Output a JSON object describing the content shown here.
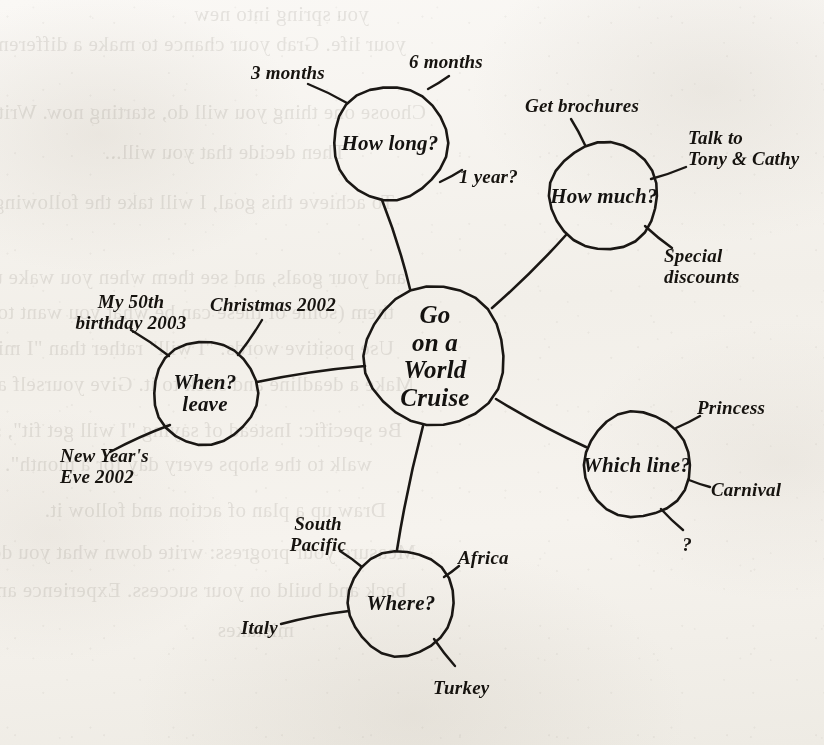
{
  "document": {
    "kind": "hand-drawn mind map",
    "background_bleed_through": [
      "you spring into new",
      "your life. Grab your chance to make a difference!",
      "Choose one thing you will do, starting now. Write it down.",
      "Then decide that you will...",
      "To achieve this goal, I will take the following steps:",
      "and your goals, and see them when you wake up",
      "them (some of these can be what you want to have)",
      "Use positive words: \"I will\" rather than \"I might\"",
      "Make a deadline and stick to it. Give yourself a reward",
      "Be specific: Instead of saying \"I will get fit\", say \"I will",
      "walk to the shops every day for a month\". Why?",
      "Draw up a plan of action and follow it.",
      "Measure your progress: write down what you do daily. Look",
      "back and build on your success. Experience and learn from",
      "mistakes"
    ]
  },
  "mindmap": {
    "center": {
      "id": "go-on-a-world-cruise",
      "label": "Go\non a\nWorld\nCruise",
      "cx": 435,
      "cy": 356,
      "r": 70
    },
    "branches": [
      {
        "id": "how-long",
        "label": "How long?",
        "cx": 390,
        "cy": 143,
        "r": 57,
        "leaves": [
          {
            "id": "three-months",
            "label": "3 months",
            "x": 288,
            "y": 73,
            "align": "c",
            "ax": 347,
            "ay": 103,
            "bx": 308,
            "by": 84
          },
          {
            "id": "six-months",
            "label": "6 months",
            "x": 446,
            "y": 62,
            "align": "c",
            "ax": 428,
            "ay": 89,
            "bx": 449,
            "by": 76
          },
          {
            "id": "one-year",
            "label": "1 year?",
            "x": 459,
            "y": 177,
            "align": "l",
            "ax": 440,
            "ay": 182,
            "bx": 462,
            "by": 170
          }
        ]
      },
      {
        "id": "how-much",
        "label": "How much?",
        "cx": 604,
        "cy": 196,
        "r": 54,
        "leaves": [
          {
            "id": "get-brochures",
            "label": "Get brochures",
            "x": 582,
            "y": 106,
            "align": "c",
            "ax": 585,
            "ay": 145,
            "bx": 571,
            "by": 119
          },
          {
            "id": "talk-to-tony-cathy",
            "label": "Talk to\nTony & Cathy",
            "x": 688,
            "y": 148,
            "align": "l",
            "ax": 651,
            "ay": 179,
            "bx": 686,
            "by": 167
          },
          {
            "id": "special-discounts",
            "label": "Special\ndiscounts",
            "x": 664,
            "y": 266,
            "align": "l",
            "ax": 645,
            "ay": 226,
            "bx": 672,
            "by": 248
          }
        ]
      },
      {
        "id": "which-line",
        "label": "Which line?",
        "cx": 637,
        "cy": 465,
        "r": 53,
        "leaves": [
          {
            "id": "princess",
            "label": "Princess",
            "x": 697,
            "y": 408,
            "align": "l",
            "ax": 676,
            "ay": 428,
            "bx": 700,
            "by": 416
          },
          {
            "id": "carnival",
            "label": "Carnival",
            "x": 711,
            "y": 490,
            "align": "l",
            "ax": 689,
            "ay": 480,
            "bx": 710,
            "by": 487
          },
          {
            "id": "unknown-line",
            "label": "?",
            "x": 687,
            "y": 545,
            "align": "c",
            "ax": 661,
            "ay": 509,
            "bx": 683,
            "by": 530
          }
        ]
      },
      {
        "id": "where",
        "label": "Where?",
        "cx": 401,
        "cy": 603,
        "r": 53,
        "leaves": [
          {
            "id": "south-pacific",
            "label": "South\nPacific",
            "x": 318,
            "y": 534,
            "align": "c",
            "ax": 362,
            "ay": 567,
            "bx": 340,
            "by": 551
          },
          {
            "id": "africa",
            "label": "Africa",
            "x": 458,
            "y": 558,
            "align": "l",
            "ax": 444,
            "ay": 577,
            "bx": 459,
            "by": 566
          },
          {
            "id": "italy",
            "label": "Italy",
            "x": 241,
            "y": 628,
            "align": "l",
            "ax": 349,
            "ay": 611,
            "bx": 281,
            "by": 624
          },
          {
            "id": "turkey",
            "label": "Turkey",
            "x": 433,
            "y": 688,
            "align": "l",
            "ax": 434,
            "ay": 639,
            "bx": 455,
            "by": 666
          }
        ]
      },
      {
        "id": "when-leave",
        "label": "When?\nleave",
        "cx": 205,
        "cy": 393,
        "r": 52,
        "leaves": [
          {
            "id": "my-50th-birthday",
            "label": "My 50th\nbirthday 2003",
            "x": 131,
            "y": 312,
            "align": "c",
            "ax": 169,
            "ay": 356,
            "bx": 131,
            "by": 330
          },
          {
            "id": "christmas-2002",
            "label": "Christmas 2002",
            "x": 273,
            "y": 305,
            "align": "c",
            "ax": 238,
            "ay": 355,
            "bx": 262,
            "by": 320
          },
          {
            "id": "new-years-eve",
            "label": "New Year's\nEve 2002",
            "x": 60,
            "y": 466,
            "align": "l",
            "ax": 170,
            "ay": 425,
            "bx": 110,
            "by": 452
          }
        ]
      }
    ],
    "connectors": [
      {
        "id": "center-to-how-long",
        "from": "go-on-a-world-cruise",
        "to": "how-long",
        "x1": 410,
        "y1": 289,
        "x2": 382,
        "y2": 200
      },
      {
        "id": "center-to-how-much",
        "from": "go-on-a-world-cruise",
        "to": "how-much",
        "x1": 492,
        "y1": 308,
        "x2": 566,
        "y2": 235
      },
      {
        "id": "center-to-which-line",
        "from": "go-on-a-world-cruise",
        "to": "which-line",
        "x1": 496,
        "y1": 399,
        "x2": 586,
        "y2": 447
      },
      {
        "id": "center-to-where",
        "from": "go-on-a-world-cruise",
        "to": "where",
        "x1": 423,
        "y1": 426,
        "x2": 397,
        "y2": 550
      },
      {
        "id": "center-to-when-leave",
        "from": "go-on-a-world-cruise",
        "to": "when-leave",
        "x1": 365,
        "y1": 366,
        "x2": 257,
        "y2": 382
      }
    ]
  }
}
